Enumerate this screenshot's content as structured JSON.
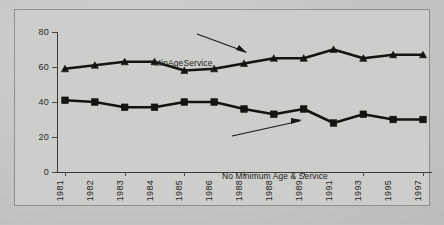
{
  "chart_data": {
    "type": "line",
    "title": "",
    "xlabel": "",
    "ylabel": "",
    "ylim": [
      0,
      80
    ],
    "yticks": [
      0,
      20,
      40,
      60,
      80
    ],
    "grid": false,
    "legend": "annotations-inline",
    "categories": [
      "1981",
      "1982",
      "1983",
      "1984",
      "1985",
      "1986",
      "1988",
      "1988",
      "1989",
      "1991",
      "1993",
      "1995",
      "1997"
    ],
    "series": [
      {
        "name": "MinAgeService",
        "marker": "triangle",
        "values": [
          59,
          61,
          63,
          63,
          58,
          59,
          62,
          65,
          65,
          70,
          65,
          67,
          67
        ]
      },
      {
        "name": "No Minimum Age & Service",
        "marker": "square",
        "values": [
          41,
          40,
          37,
          37,
          40,
          40,
          36,
          33,
          36,
          28,
          33,
          30,
          30
        ]
      }
    ],
    "annotations": [
      {
        "text": "MinAgeService",
        "points_to": "1985"
      },
      {
        "text": "No Minimum Age & Service",
        "points_to": "1988"
      }
    ]
  },
  "colors": {
    "background": "#c8c8c6",
    "plot_background": "#cdcdcb",
    "line": "#15150f",
    "axis": "#3a3a38",
    "text": "#242422",
    "frame_border": "#8e8e8c"
  },
  "yticklabels": [
    "80",
    "60",
    "40",
    "20",
    "0"
  ]
}
